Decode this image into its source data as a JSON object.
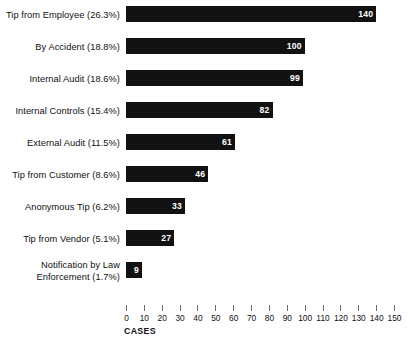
{
  "chart_data": {
    "type": "bar",
    "orientation": "horizontal",
    "title": "",
    "xlabel": "CASES",
    "ylabel": "",
    "xlim": [
      0,
      150
    ],
    "xticks": [
      0,
      10,
      20,
      30,
      40,
      50,
      60,
      70,
      80,
      90,
      100,
      110,
      120,
      130,
      140,
      150
    ],
    "grid": false,
    "legend": "none",
    "bar_color": "#111111",
    "value_label_color": "#ffffff",
    "categories": [
      "Tip from Employee (26.3%)",
      "By Accident (18.8%)",
      "Internal Audit (18.6%)",
      "Internal Controls (15.4%)",
      "External Audit (11.5%)",
      "Tip from Customer (8.6%)",
      "Anonymous Tip (6.2%)",
      "Tip from Vendor (5.1%)",
      "Notification by Law\nEnforcement (1.7%)"
    ],
    "percentages": [
      26.3,
      18.8,
      18.6,
      15.4,
      11.5,
      8.6,
      6.2,
      5.1,
      1.7
    ],
    "values": [
      140,
      100,
      99,
      82,
      61,
      46,
      33,
      27,
      9
    ],
    "value_labels": [
      "140",
      "100",
      "99",
      "82",
      "61",
      "46",
      "33",
      "27",
      "9"
    ],
    "tick_labels": [
      "0",
      "10",
      "20",
      "30",
      "40",
      "50",
      "60",
      "70",
      "80",
      "90",
      "100",
      "110",
      "120",
      "130",
      "140",
      "150"
    ]
  }
}
